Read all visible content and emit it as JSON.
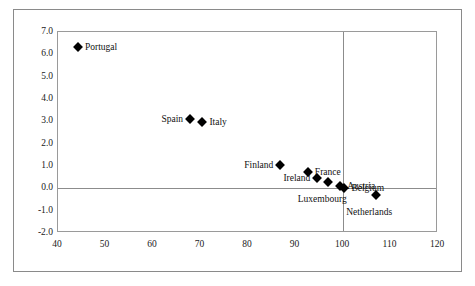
{
  "chart_data": {
    "type": "scatter",
    "title": "",
    "xlabel": "",
    "ylabel": "",
    "xlim": [
      40,
      120
    ],
    "ylim": [
      -2.0,
      7.0
    ],
    "xticks": [
      "40",
      "50",
      "60",
      "70",
      "80",
      "90",
      "100",
      "110",
      "120"
    ],
    "yticks": [
      "7.0",
      "6.0",
      "5.0",
      "4.0",
      "3.0",
      "2.0",
      "1.0",
      "0.0",
      "-1.0",
      "-2.0"
    ],
    "grid": false,
    "legend": "none",
    "reference_lines": [
      {
        "name": "zero-horizontal",
        "axis": "y",
        "value": 0.0
      },
      {
        "name": "hundred-vertical",
        "axis": "x",
        "value": 100
      }
    ],
    "marker_shape": "diamond",
    "marker_color": "#000000",
    "points": [
      {
        "label": "Portugal",
        "x": 44.2,
        "y": 6.35,
        "label_pos": "right"
      },
      {
        "label": "Spain",
        "x": 67.8,
        "y": 3.12,
        "label_pos": "left"
      },
      {
        "label": "Italy",
        "x": 70.4,
        "y": 2.95,
        "label_pos": "right"
      },
      {
        "label": "Finland",
        "x": 86.8,
        "y": 1.05,
        "label_pos": "left"
      },
      {
        "label": "France",
        "x": 92.6,
        "y": 0.72,
        "label_pos": "right"
      },
      {
        "label": "Ireland",
        "x": 94.6,
        "y": 0.47,
        "label_pos": "left"
      },
      {
        "label": "Luxembourg",
        "x": 96.8,
        "y": 0.28,
        "label_pos": "below"
      },
      {
        "label": "Austria",
        "x": 99.4,
        "y": 0.12,
        "label_pos": "right"
      },
      {
        "label": "Belgium",
        "x": 100.3,
        "y": 0.03,
        "label_pos": "right"
      },
      {
        "label": "Netherlands",
        "x": 107.0,
        "y": -0.3,
        "label_pos": "below"
      }
    ]
  },
  "axes": {
    "x_tick_labels": [
      "40",
      "50",
      "60",
      "70",
      "80",
      "90",
      "100",
      "110",
      "120"
    ],
    "y_tick_labels": [
      "7.0",
      "6.0",
      "5.0",
      "4.0",
      "3.0",
      "2.0",
      "1.0",
      "0.0",
      "-1.0",
      "-2.0"
    ]
  }
}
